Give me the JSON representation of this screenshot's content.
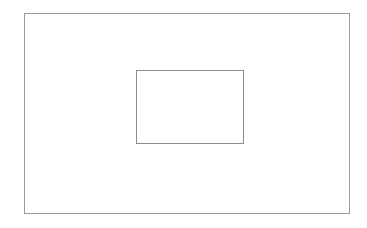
{
  "canvas": {
    "width": 367,
    "height": 228,
    "background_color": "#ffffff",
    "title": ""
  },
  "chart_data": {
    "type": "diagram",
    "title": "",
    "subtitle": "",
    "xlabel": "",
    "ylabel": "",
    "legend": [],
    "annotations": [],
    "grid": false,
    "shapes": [
      {
        "id": "outer-rect",
        "kind": "rectangle",
        "label": "",
        "x": 24,
        "y": 13,
        "width": 326,
        "height": 201,
        "stroke_color": "#9a9a9a",
        "stroke_width": 1,
        "fill_color": "none"
      },
      {
        "id": "inner-rect",
        "kind": "rectangle",
        "label": "",
        "x": 136,
        "y": 70,
        "width": 108,
        "height": 74,
        "stroke_color": "#8c8c8c",
        "stroke_width": 1,
        "fill_color": "none"
      }
    ]
  },
  "shapes": {
    "outer": {
      "name": "outer-rectangle",
      "label": "",
      "stroke_color": "#9a9a9a",
      "fill_color": "none"
    },
    "inner": {
      "name": "inner-rectangle",
      "label": "",
      "stroke_color": "#8c8c8c",
      "fill_color": "none"
    }
  }
}
